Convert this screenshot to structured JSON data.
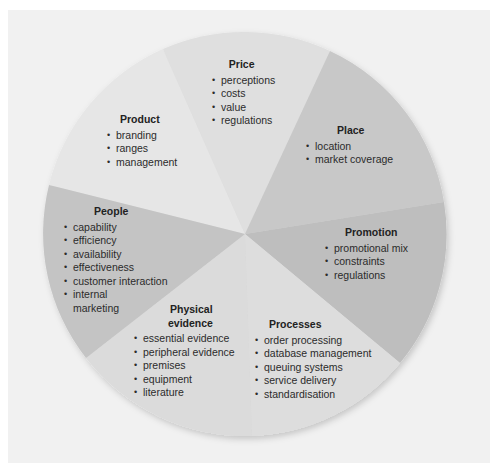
{
  "diagram": {
    "type": "pie-segments",
    "colors": {
      "background_panel": "#f1f1f1",
      "product": "#e4e4e4",
      "price": "#dedede",
      "place": "#c6c6c6",
      "promotion": "#bcbcbc",
      "processes": "#dcdcdc",
      "physical_evidence": "#dadada",
      "people": "#c3c3c3"
    },
    "segments": [
      {
        "id": "price",
        "title": "Price",
        "items": [
          "perceptions",
          "costs",
          "value",
          "regulations"
        ]
      },
      {
        "id": "place",
        "title": "Place",
        "items": [
          "location",
          "market coverage"
        ]
      },
      {
        "id": "promotion",
        "title": "Promotion",
        "items": [
          "promotional mix",
          "constraints",
          "regulations"
        ]
      },
      {
        "id": "processes",
        "title": "Processes",
        "items": [
          "order processing",
          "database management",
          "queuing systems",
          "service delivery",
          "standardisation"
        ]
      },
      {
        "id": "physical_evidence",
        "title_line1": "Physical",
        "title_line2": "evidence",
        "items": [
          "essential evidence",
          "peripheral evidence",
          "premises",
          "equipment",
          "literature"
        ]
      },
      {
        "id": "people",
        "title": "People",
        "items": [
          "capability",
          "efficiency",
          "availability",
          "effectiveness",
          "customer interaction",
          "internal",
          "marketing"
        ]
      },
      {
        "id": "product",
        "title": "Product",
        "items": [
          "branding",
          "ranges",
          "management"
        ]
      }
    ]
  }
}
